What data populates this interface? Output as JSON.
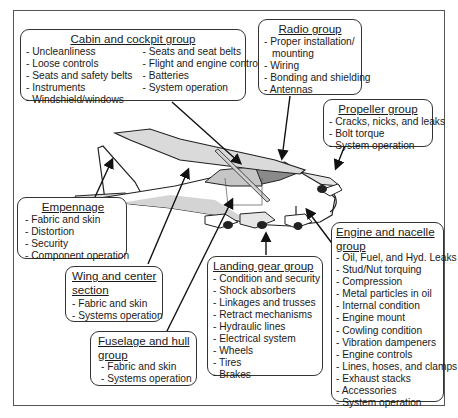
{
  "diagram": {
    "type": "aircraft inspection groups",
    "groups": {
      "cabin": {
        "title": "Cabin and cockpit group",
        "items_col1": [
          "- Uncleanliness",
          "- Loose controls",
          "- Seats and safety belts",
          "- Instruments",
          "- Windshield/windows"
        ],
        "items_col2": [
          "- Seats and seat belts",
          "- Flight and engine controls",
          "- Batteries",
          "- System operation"
        ]
      },
      "radio": {
        "title": "Radio group",
        "items": [
          "- Proper installation/",
          "  mounting",
          "- Wiring",
          "- Bonding and shielding",
          "- Antennas"
        ]
      },
      "propeller": {
        "title": "Propeller group",
        "items": [
          "- Cracks, nicks, and leaks",
          "- Bolt torque",
          "- System operation"
        ]
      },
      "empennage": {
        "title": "Empennage",
        "items": [
          "- Fabric and skin",
          "- Distortion",
          "- Security",
          "- Component operation"
        ]
      },
      "wing": {
        "title_line1": "Wing and center",
        "title_line2": "section",
        "items": [
          "- Fabric and skin",
          "- Systems operation"
        ]
      },
      "fuselage": {
        "title_line1": "Fuselage and hull",
        "title_line2": "group",
        "items": [
          "- Fabric and skin",
          "- Systems operation"
        ]
      },
      "landing": {
        "title": "Landing gear group",
        "items": [
          "- Condition and security",
          "- Shock absorbers",
          "- Linkages and trusses",
          "- Retract mechanisms",
          "- Hydraulic lines",
          "- Electrical system",
          "- Wheels",
          "- Tires",
          "- Brakes"
        ]
      },
      "engine": {
        "title_line1": "Engine and nacelle",
        "title_line2": "group",
        "items": [
          "- Oil, Fuel, and Hyd. Leaks",
          "- Stud/Nut torquing",
          "- Compression",
          "- Metal particles in oil",
          "- Internal condition",
          "- Engine mount",
          "- Cowling condition",
          "- Vibration dampeners",
          "- Engine controls",
          "- Lines, hoses, and clamps",
          "- Exhaust stacks",
          "- Accessories",
          "- System operation"
        ]
      }
    },
    "colors": {
      "line": "#1a1a1a",
      "shade": "#d4d4d4",
      "dark_shade": "#8a8a8a",
      "border": "#333333"
    }
  }
}
